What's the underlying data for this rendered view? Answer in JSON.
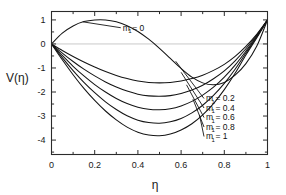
{
  "chart_data": {
    "type": "line",
    "title": "",
    "xlabel": "η",
    "ylabel": "V(η)",
    "xlim": [
      0,
      1
    ],
    "ylim": [
      -4.6,
      1.35
    ],
    "grid": false,
    "zero_line": true,
    "legend_position": "inline-right",
    "xticks": [
      "0",
      "0.2",
      "0.4",
      "0.6",
      "0.8",
      "1"
    ],
    "xtick_values": [
      0,
      0.2,
      0.4,
      0.6,
      0.8,
      1
    ],
    "xminor_count": 1,
    "yticks": [
      "1",
      "0",
      "-1",
      "-2",
      "-3",
      "-4"
    ],
    "ytick_values": [
      1,
      0,
      -1,
      -2,
      -3,
      -4
    ],
    "yminor_count": 1,
    "x": [
      0,
      0.05,
      0.1,
      0.15,
      0.2,
      0.25,
      0.3,
      0.35,
      0.4,
      0.45,
      0.5,
      0.55,
      0.6,
      0.65,
      0.7,
      0.75,
      0.8,
      0.85,
      0.9,
      0.95,
      1
    ],
    "series": [
      {
        "name": "m = 0",
        "label": "m",
        "sub": "1",
        "value": "= 0",
        "values": [
          0,
          0.45,
          0.75,
          0.93,
          1.0,
          1.0,
          0.92,
          0.76,
          0.52,
          0.2,
          -0.18,
          -0.6,
          -1.02,
          -1.38,
          -1.62,
          -1.7,
          -1.6,
          -1.3,
          -0.82,
          -0.1,
          1.0
        ]
      },
      {
        "name": "m = 0.2",
        "label": "m",
        "sub": "1",
        "value": "= 0.2",
        "values": [
          0,
          -0.27,
          -0.52,
          -0.75,
          -0.96,
          -1.15,
          -1.31,
          -1.44,
          -1.54,
          -1.6,
          -1.62,
          -1.6,
          -1.54,
          -1.44,
          -1.3,
          -1.1,
          -0.85,
          -0.52,
          -0.1,
          0.4,
          1.0
        ]
      },
      {
        "name": "m = 0.4",
        "label": "m",
        "sub": "1",
        "value": "= 0.4",
        "values": [
          0,
          -0.38,
          -0.73,
          -1.05,
          -1.33,
          -1.58,
          -1.79,
          -1.96,
          -2.09,
          -2.16,
          -2.18,
          -2.15,
          -2.06,
          -1.92,
          -1.72,
          -1.45,
          -1.12,
          -0.7,
          -0.2,
          0.36,
          1.0
        ]
      },
      {
        "name": "m = 0.6",
        "label": "m",
        "sub": "1",
        "value": "= 0.6",
        "values": [
          0,
          -0.48,
          -0.93,
          -1.33,
          -1.69,
          -2.0,
          -2.27,
          -2.48,
          -2.63,
          -2.72,
          -2.74,
          -2.7,
          -2.58,
          -2.39,
          -2.13,
          -1.8,
          -1.38,
          -0.88,
          -0.3,
          0.32,
          1.0
        ]
      },
      {
        "name": "m = 0.8",
        "label": "m",
        "sub": "1",
        "value": "= 0.8",
        "values": [
          0,
          -0.57,
          -1.11,
          -1.6,
          -2.03,
          -2.41,
          -2.73,
          -2.99,
          -3.17,
          -3.27,
          -3.3,
          -3.24,
          -3.1,
          -2.87,
          -2.55,
          -2.14,
          -1.64,
          -1.05,
          -0.38,
          0.29,
          1.0
        ]
      },
      {
        "name": "m = 1",
        "label": "m",
        "sub": "1",
        "value": "= 1",
        "values": [
          0,
          -0.66,
          -1.28,
          -1.85,
          -2.35,
          -2.79,
          -3.16,
          -3.46,
          -3.67,
          -3.79,
          -3.82,
          -3.75,
          -3.58,
          -3.32,
          -2.95,
          -2.48,
          -1.9,
          -1.22,
          -0.46,
          0.25,
          1.0
        ]
      }
    ],
    "annotations": [
      {
        "text": "m",
        "sub": "1",
        "value": "= 0",
        "x_label": 0.33,
        "y_label": 0.55
      }
    ]
  },
  "axes": {
    "ylabel_text": "V(η)",
    "xlabel_text": "η"
  },
  "colors": {
    "curve": "#141414",
    "frame": "#2b2b2b",
    "zero_line": "#c9c9c9",
    "background": "#ffffff",
    "text": "#1a1a1a"
  }
}
